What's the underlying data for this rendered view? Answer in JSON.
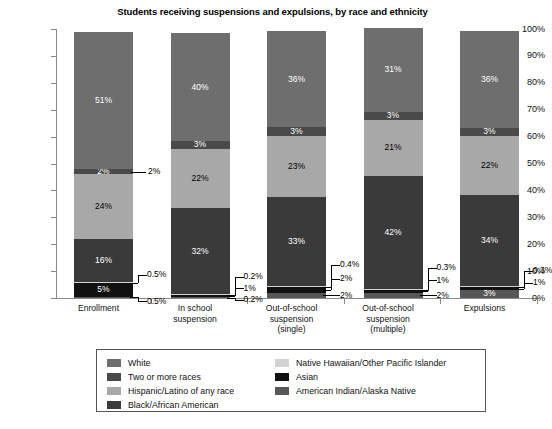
{
  "chart_data": {
    "type": "bar",
    "subtype": "stacked-percentage",
    "title": "Students receiving suspensions and expulsions, by race and ethnicity",
    "xlabel": "",
    "ylabel": "",
    "ylim": [
      0,
      100
    ],
    "ytick_labels": [
      "100%",
      "90%",
      "80%",
      "70%",
      "60%",
      "50%",
      "40%",
      "30%",
      "20%",
      "10%",
      "0%"
    ],
    "ytick_values": [
      100,
      90,
      80,
      70,
      60,
      50,
      40,
      30,
      20,
      10,
      0
    ],
    "grid": false,
    "legend_position": "bottom",
    "categories": [
      "Enrollment",
      "In school suspension",
      "Out-of-school suspension (single)",
      "Out-of-school suspension (multiple)",
      "Expulsions"
    ],
    "series": [
      {
        "name": "White",
        "color": "#6e6e6e",
        "values": [
          51,
          40,
          36,
          31,
          36
        ],
        "labels": [
          "51%",
          "40%",
          "36%",
          "31%",
          "36%"
        ]
      },
      {
        "name": "Two or more races",
        "color": "#4a4a4a",
        "values": [
          2,
          3,
          3,
          3,
          3
        ],
        "labels": [
          "2%",
          "3%",
          "3%",
          "3%",
          "3%"
        ]
      },
      {
        "name": "Hispanic/Latino of any race",
        "color": "#a8a8a8",
        "values": [
          24,
          22,
          23,
          21,
          22
        ],
        "labels": [
          "24%",
          "22%",
          "23%",
          "21%",
          "22%"
        ]
      },
      {
        "name": "Black/African American",
        "color": "#3a3a3a",
        "values": [
          16,
          32,
          33,
          42,
          34
        ],
        "labels": [
          "16%",
          "32%",
          "33%",
          "42%",
          "34%"
        ]
      },
      {
        "name": "Native Hawaiian/Other Pacific Islander",
        "color": "#d2d2d2",
        "values": [
          0.5,
          0.2,
          0.4,
          0.3,
          0.3
        ],
        "labels": [
          "0.5%",
          "0.2%",
          "0.4%",
          "0.3%",
          "0.3%"
        ]
      },
      {
        "name": "Asian",
        "color": "#111111",
        "values": [
          5,
          1,
          2,
          1,
          1
        ],
        "labels": [
          "5%",
          "1%",
          "2%",
          "1%",
          "1%"
        ]
      },
      {
        "name": "American Indian/Alaska Native",
        "color": "#575757",
        "values": [
          0.5,
          0.2,
          2,
          2,
          3
        ],
        "labels": [
          "0.5%",
          "0.2%",
          "2%",
          "2%",
          "3%"
        ]
      }
    ]
  },
  "legend": {
    "entries": [
      {
        "label": "White",
        "color": "#6e6e6e"
      },
      {
        "label": "Two or more races",
        "color": "#4a4a4a"
      },
      {
        "label": "Hispanic/Latino of any race",
        "color": "#a8a8a8"
      },
      {
        "label": "Black/African American",
        "color": "#3a3a3a"
      },
      {
        "label": "Native Hawaiian/Other Pacific Islander",
        "color": "#d2d2d2"
      },
      {
        "label": "Asian",
        "color": "#111111"
      },
      {
        "label": "American Indian/Alaska Native",
        "color": "#575757"
      }
    ]
  },
  "x_axis": {
    "labels": [
      [
        "Enrollment"
      ],
      [
        "In school",
        "suspension"
      ],
      [
        "Out-of-school",
        "suspension",
        "(single)"
      ],
      [
        "Out-of-school",
        "suspension",
        "(multiple)"
      ],
      [
        "Expulsions"
      ]
    ]
  }
}
